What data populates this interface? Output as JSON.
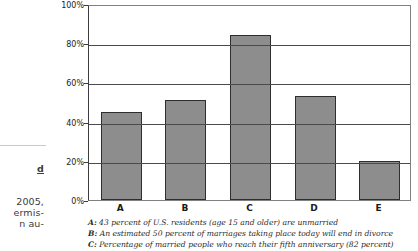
{
  "margin_fragment": {
    "lines": [
      {
        "text": "d",
        "top": 163,
        "underline": true
      },
      {
        "text": "2005,",
        "top": 196
      },
      {
        "text": "ermis-",
        "top": 207
      },
      {
        "text": "n au-",
        "top": 218
      }
    ]
  },
  "chart_data": {
    "type": "bar",
    "title": "",
    "subtitle": "",
    "xlabel": "",
    "ylabel": "",
    "categories": [
      "A",
      "B",
      "C",
      "D",
      "E"
    ],
    "values": [
      45,
      51,
      84,
      53,
      20
    ],
    "ylim": [
      0,
      100
    ],
    "ytick_labels": [
      "0%",
      "20%",
      "40%",
      "60%",
      "80%",
      "100%"
    ],
    "ytick_values": [
      0,
      20,
      40,
      60,
      80,
      100
    ],
    "grid": true,
    "grid_axis": "y",
    "legend_position": "none",
    "bar_color": "#8d8d8d",
    "bar_edge_color": "#2e2e2e",
    "annotations": [
      "A: 43 percent of U.S. residents (age 15 and older) are unmarried",
      "B: An estimated 50 percent of marriages taking place today will end in divorce",
      "C: Percentage of married people who reach their fifth anniversary (82 percent)"
    ]
  },
  "caption": {
    "lines": [
      {
        "key": "A:",
        "text": " 43 percent of U.S. residents (age 15 and older) are unmarried"
      },
      {
        "key": "B:",
        "text": " An estimated 50 percent of marriages taking place today will end in divorce"
      },
      {
        "key": "C:",
        "text": " Percentage of married people who reach their fifth anniversary (82 percent)"
      }
    ]
  }
}
